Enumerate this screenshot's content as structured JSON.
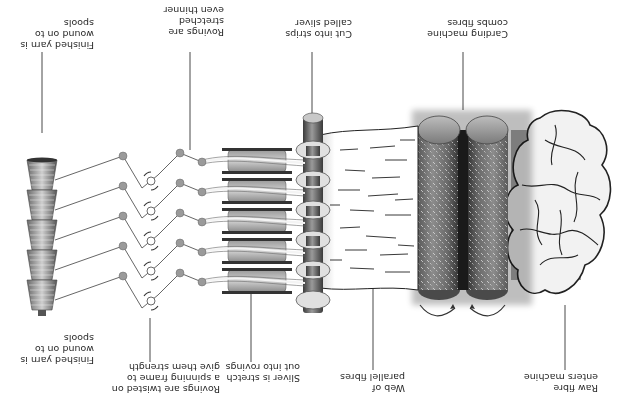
{
  "diagram": {
    "orientation": "rotated 180 degrees",
    "colors": {
      "background": "#ffffff",
      "line": "#3a3a3a",
      "roller_dark": "#4a4a4a",
      "roller_mid": "#8a8a8a",
      "roller_light": "#cfcfcf",
      "fibre_fill": "#f2f2f2",
      "feed_belt": "#a8a8a8"
    },
    "labels": {
      "raw_fibre": "Raw fibre\nenters machine",
      "carding": "Carding machine\ncombs fibres",
      "web": "Web of\nparallel fibres",
      "sliver": "Cut into strips\ncalled sliver",
      "rovings_stretch": "Sliver is stretch\nout into rovings",
      "rovings_thinner": "Rovings are\nstretched\neven thinner",
      "spinning": "Rovings are twisted on\na spinning frame to\ngive them strength",
      "spools_top": "Finished yarn is\nwound on to spools",
      "spools_bottom": "Finished yarn is\nwound on to spools"
    },
    "stages": [
      {
        "id": "raw-fibre",
        "icon": "fibre-cloud-icon"
      },
      {
        "id": "carding",
        "icon": "carding-rollers-icon"
      },
      {
        "id": "web",
        "icon": "fibre-web-icon"
      },
      {
        "id": "sliver",
        "icon": "sliver-condenser-icon"
      },
      {
        "id": "drafting",
        "icon": "drafting-rollers-icon"
      },
      {
        "id": "spinning",
        "icon": "spinning-frame-icon"
      },
      {
        "id": "spools",
        "icon": "yarn-spool-icon"
      }
    ]
  }
}
